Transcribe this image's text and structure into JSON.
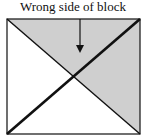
{
  "diagram": {
    "label": "Wrong side of block",
    "colors": {
      "shade": "#cfcfcf",
      "background": "#ffffff",
      "stroke": "#111111"
    },
    "square": {
      "x1": 7,
      "y1": 19,
      "x2": 140,
      "y2": 134
    },
    "shaded_regions": [
      "top-triangle",
      "right-triangle"
    ],
    "diagonals": [
      {
        "name": "diagonal-top-left-to-bottom-right",
        "weight": "thin"
      },
      {
        "name": "diagonal-top-right-to-bottom-left",
        "weight": "thick"
      }
    ],
    "arrow": {
      "x": 80,
      "y_start": 19,
      "y_end": 52,
      "points_to": "top-triangle"
    }
  }
}
